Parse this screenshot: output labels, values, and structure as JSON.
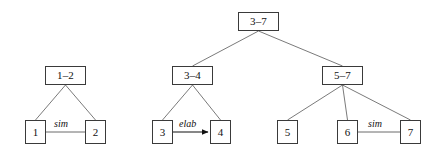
{
  "diagram": {
    "type": "discourse-tree",
    "canvas": {
      "width": 432,
      "height": 148,
      "background": "#ffffff"
    },
    "style": {
      "node_border_color": "#3a3a3a",
      "node_fill_color": "#ffffff",
      "edge_color": "#6b6b6b",
      "text_color": "#111111",
      "arrow_color": "#111111"
    },
    "nodes": [
      {
        "id": "n1-2",
        "label": "1–2",
        "x": 45,
        "y": 66,
        "w": 41,
        "h": 19,
        "kind": "span-node"
      },
      {
        "id": "n1",
        "label": "1",
        "x": 25,
        "y": 120,
        "w": 21,
        "h": 24,
        "kind": "leaf-node"
      },
      {
        "id": "n2",
        "label": "2",
        "x": 85,
        "y": 120,
        "w": 21,
        "h": 24,
        "kind": "leaf-node"
      },
      {
        "id": "n3-7",
        "label": "3–7",
        "x": 238,
        "y": 12,
        "w": 41,
        "h": 19,
        "kind": "span-node"
      },
      {
        "id": "n3-4",
        "label": "3–4",
        "x": 172,
        "y": 66,
        "w": 41,
        "h": 19,
        "kind": "span-node"
      },
      {
        "id": "n5-7",
        "label": "5–7",
        "x": 322,
        "y": 66,
        "w": 41,
        "h": 19,
        "kind": "span-node"
      },
      {
        "id": "n3",
        "label": "3",
        "x": 152,
        "y": 120,
        "w": 21,
        "h": 24,
        "kind": "leaf-node"
      },
      {
        "id": "n4",
        "label": "4",
        "x": 210,
        "y": 120,
        "w": 21,
        "h": 24,
        "kind": "leaf-node"
      },
      {
        "id": "n5",
        "label": "5",
        "x": 277,
        "y": 120,
        "w": 21,
        "h": 24,
        "kind": "leaf-node"
      },
      {
        "id": "n6",
        "label": "6",
        "x": 337,
        "y": 120,
        "w": 21,
        "h": 24,
        "kind": "leaf-node"
      },
      {
        "id": "n7",
        "label": "7",
        "x": 400,
        "y": 120,
        "w": 21,
        "h": 24,
        "kind": "leaf-node"
      }
    ],
    "tree_edges": [
      {
        "id": "e-1-2_1",
        "from": "n1-2",
        "to": "n1",
        "x1": 65.5,
        "y1": 85,
        "x2": 35.5,
        "y2": 120
      },
      {
        "id": "e-1-2_2",
        "from": "n1-2",
        "to": "n2",
        "x1": 65.5,
        "y1": 85,
        "x2": 95.5,
        "y2": 120
      },
      {
        "id": "e-3-7_3-4",
        "from": "n3-7",
        "to": "n3-4",
        "x1": 258.5,
        "y1": 31,
        "x2": 192.5,
        "y2": 66
      },
      {
        "id": "e-3-7_5-7",
        "from": "n3-7",
        "to": "n5-7",
        "x1": 258.5,
        "y1": 31,
        "x2": 342.5,
        "y2": 66
      },
      {
        "id": "e-3-4_3",
        "from": "n3-4",
        "to": "n3",
        "x1": 192.5,
        "y1": 85,
        "x2": 162.5,
        "y2": 120
      },
      {
        "id": "e-3-4_4",
        "from": "n3-4",
        "to": "n4",
        "x1": 192.5,
        "y1": 85,
        "x2": 220.5,
        "y2": 120
      },
      {
        "id": "e-5-7_5",
        "from": "n5-7",
        "to": "n5",
        "x1": 342.5,
        "y1": 85,
        "x2": 287.5,
        "y2": 120
      },
      {
        "id": "e-5-7_6",
        "from": "n5-7",
        "to": "n6",
        "x1": 342.5,
        "y1": 85,
        "x2": 347.5,
        "y2": 120
      },
      {
        "id": "e-5-7_7",
        "from": "n5-7",
        "to": "n7",
        "x1": 342.5,
        "y1": 85,
        "x2": 410.5,
        "y2": 120
      }
    ],
    "relation_edges": [
      {
        "id": "r-sim-1-2",
        "label": "sim",
        "from": "n1",
        "to": "n2",
        "arrow": false,
        "x1": 46,
        "y1": 132,
        "x2": 85,
        "y2": 132,
        "label_x": 53,
        "label_y": 118
      },
      {
        "id": "r-elab-3-4",
        "label": "elab",
        "from": "n3",
        "to": "n4",
        "arrow": true,
        "x1": 173,
        "y1": 132,
        "x2": 209,
        "y2": 132,
        "label_x": 178,
        "label_y": 118
      },
      {
        "id": "r-sim-6-7",
        "label": "sim",
        "from": "n6",
        "to": "n7",
        "arrow": false,
        "x1": 358,
        "y1": 132,
        "x2": 400,
        "y2": 132,
        "label_x": 367,
        "label_y": 118
      }
    ]
  }
}
